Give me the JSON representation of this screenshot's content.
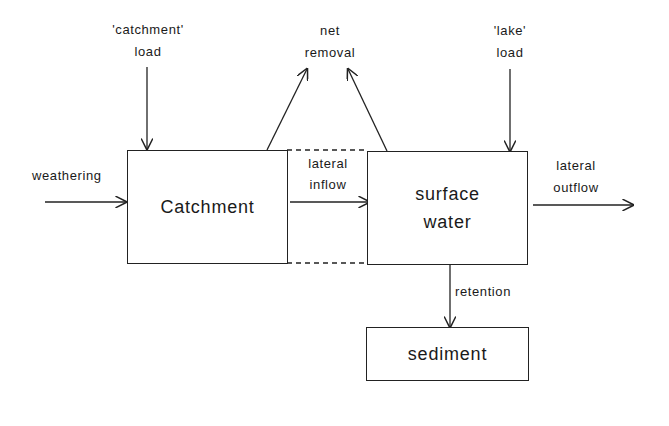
{
  "boxes": {
    "catchment": "Catchment",
    "surface_water_line1": "surface",
    "surface_water_line2": "water",
    "sediment": "sediment"
  },
  "flows": {
    "weathering": "weathering",
    "catchment_load_line1": "'catchment'",
    "catchment_load_line2": "load",
    "net_removal_line1": "net",
    "net_removal_line2": "removal",
    "lake_load_line1": "'lake'",
    "lake_load_line2": "load",
    "lateral_inflow_line1": "lateral",
    "lateral_inflow_line2": "inflow",
    "lateral_outflow_line1": "lateral",
    "lateral_outflow_line2": "outflow",
    "retention": "retention"
  },
  "colors": {
    "line": "#222222",
    "background": "#ffffff"
  }
}
